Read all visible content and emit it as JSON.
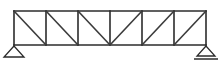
{
  "figure": {
    "background_color": "#ffffff",
    "line_color": "#2b2b2b",
    "diagonal_color": "#3a3a3a"
  },
  "geometry": {
    "canvas_width": 220,
    "canvas_height": 63,
    "span_left_x": 14,
    "span_right_x": 206,
    "top_chord_y": 11,
    "bottom_chord_y": 45,
    "panel_count": 6,
    "panel_width": 32,
    "truss_depth": 34,
    "node_x_positions": [
      14,
      46,
      78,
      110,
      142,
      174,
      206
    ],
    "mirror_axis_x": 110
  },
  "members": {
    "top_chord": {
      "label": "top-chord",
      "from_x": 14,
      "to_x": 206,
      "y": 11
    },
    "bottom_chord": {
      "label": "bottom-chord",
      "from_x": 14,
      "to_x": 206,
      "y": 45
    },
    "verticals": [
      {
        "label": "vertical-1",
        "x": 14
      },
      {
        "label": "vertical-2",
        "x": 46
      },
      {
        "label": "vertical-3",
        "x": 78
      },
      {
        "label": "vertical-4",
        "x": 110
      },
      {
        "label": "vertical-5",
        "x": 142
      },
      {
        "label": "vertical-6",
        "x": 174
      },
      {
        "label": "vertical-7",
        "x": 206
      }
    ],
    "diagonals": [
      {
        "label": "diagonal-1",
        "x1": 14,
        "y1": 11,
        "x2": 46,
        "y2": 45,
        "direction": "down-right"
      },
      {
        "label": "diagonal-2",
        "x1": 46,
        "y1": 11,
        "x2": 78,
        "y2": 45,
        "direction": "down-right"
      },
      {
        "label": "diagonal-3",
        "x1": 78,
        "y1": 11,
        "x2": 110,
        "y2": 45,
        "direction": "down-right"
      },
      {
        "label": "diagonal-4",
        "x1": 110,
        "y1": 45,
        "x2": 142,
        "y2": 11,
        "direction": "up-right"
      },
      {
        "label": "diagonal-5",
        "x1": 142,
        "y1": 45,
        "x2": 174,
        "y2": 11,
        "direction": "up-right"
      },
      {
        "label": "diagonal-6",
        "x1": 174,
        "y1": 45,
        "x2": 206,
        "y2": 11,
        "direction": "up-right"
      }
    ]
  },
  "supports": {
    "left": {
      "type": "pinned",
      "label": "left-support",
      "apex_x": 14,
      "apex_y": 46,
      "base_y": 57,
      "half_width": 10,
      "has_ground_line": false
    },
    "right": {
      "type": "roller",
      "label": "right-support",
      "apex_x": 206,
      "apex_y": 46,
      "base_y": 56,
      "half_width": 9,
      "has_ground_line": true,
      "ground_y": 59,
      "ground_from_x": 194,
      "ground_to_x": 218
    }
  }
}
